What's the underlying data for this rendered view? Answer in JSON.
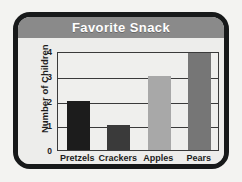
{
  "card": {
    "border_color": "#17191a",
    "background": "#e9e9e7"
  },
  "header": {
    "title": "Favorite Snack",
    "band_color": "#8a8a8a",
    "title_color": "#ffffff"
  },
  "chart_data": {
    "type": "bar",
    "title": "Favorite Snack",
    "xlabel": "",
    "ylabel": "Number of Children",
    "categories": [
      "Pretzels",
      "Crackers",
      "Apples",
      "Pears"
    ],
    "values": [
      2,
      1,
      3,
      4
    ],
    "bar_colors": [
      "#1c1c1c",
      "#3a3a3a",
      "#a8a8a8",
      "#767676"
    ],
    "ylim": [
      0,
      4
    ],
    "yticks": [
      0,
      1,
      2,
      3,
      4
    ],
    "ytick_labels": [
      "0",
      "1",
      "2",
      "3",
      "4"
    ],
    "grid": true,
    "legend": false,
    "plot_background": "#efefed",
    "axis_color": "#3a3a3a"
  }
}
